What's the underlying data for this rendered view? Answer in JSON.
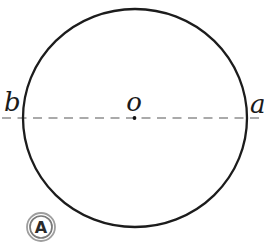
{
  "figure": {
    "labels": {
      "left_endpoint": "b",
      "center": "o",
      "right_endpoint": "a"
    },
    "badge": {
      "label": "A"
    },
    "colors": {
      "background": "#ffffff",
      "circle_stroke": "#1c1c1c",
      "dashed_line": "#8f8f8f",
      "center_dot": "#111111",
      "label_text": "#1a1a1a",
      "badge_outer_ring": "#9e9e9e",
      "badge_inner_ring": "#7a7a7a",
      "badge_letter": "#2a2a2a"
    }
  }
}
